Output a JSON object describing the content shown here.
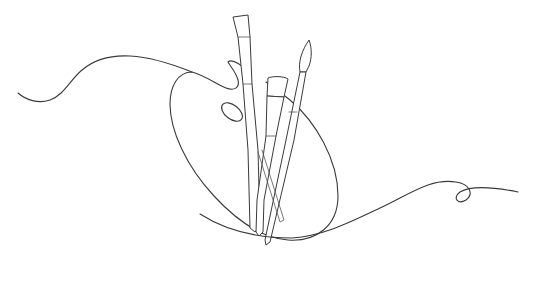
{
  "illustration": {
    "subject": "Artist palette with paintbrushes",
    "style": "continuous line drawing",
    "elements": [
      "palette",
      "thumb-hole",
      "flat-brush",
      "wide-brush",
      "round-brush",
      "flowing-line"
    ],
    "colors": {
      "background": "#ffffff",
      "stroke": "#3a3a3a"
    }
  }
}
